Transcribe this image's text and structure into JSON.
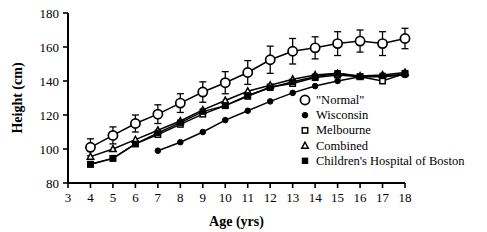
{
  "chart_data": {
    "type": "line",
    "title": "",
    "xlabel": "Age  (yrs)",
    "ylabel": "Height  (cm)",
    "xlim": [
      3,
      18
    ],
    "ylim": [
      80,
      180
    ],
    "xticks": [
      3,
      4,
      5,
      6,
      7,
      8,
      9,
      10,
      11,
      12,
      13,
      14,
      15,
      16,
      17,
      18
    ],
    "yticks": [
      80,
      100,
      120,
      140,
      160,
      180
    ],
    "grid": false,
    "legend_position": "inside-bottom-right",
    "series": [
      {
        "name": "\"Normal\"",
        "marker": "open-circle",
        "x": [
          4,
          5,
          6,
          7,
          8,
          9,
          10,
          11,
          12,
          13,
          14,
          15,
          16,
          17,
          18
        ],
        "values": [
          101,
          108,
          115,
          120.5,
          127,
          133.5,
          139,
          145,
          152.5,
          157.5,
          159.5,
          162,
          163.5,
          162,
          165
        ],
        "errors": [
          5,
          5,
          5,
          5.5,
          5.5,
          6,
          6.5,
          7,
          8,
          7.5,
          6.5,
          7,
          6.5,
          7,
          6
        ]
      },
      {
        "name": "Wisconsin",
        "marker": "filled-circle",
        "x": [
          7,
          8,
          9,
          10,
          11,
          12,
          13,
          14,
          15,
          16,
          17,
          18
        ],
        "values": [
          99,
          104,
          110,
          117,
          122.5,
          128,
          133,
          137,
          140,
          142.5,
          142.5,
          143.5
        ],
        "errors": [
          0,
          0,
          0,
          0,
          0,
          0,
          0,
          0,
          0,
          0,
          0,
          0
        ]
      },
      {
        "name": "Melbourne",
        "marker": "open-square",
        "x": [
          4,
          5,
          6,
          7,
          8,
          9,
          10,
          11,
          12,
          13,
          14,
          15,
          16,
          17,
          18
        ],
        "values": [
          91,
          94.5,
          103,
          108.5,
          114.5,
          120.5,
          125.5,
          131,
          136.5,
          138.5,
          142,
          143.5,
          142.5,
          140,
          144.5
        ],
        "errors": [
          0,
          0,
          0,
          0,
          0,
          0,
          0,
          0,
          0,
          0,
          0,
          0,
          0,
          0,
          0
        ]
      },
      {
        "name": "Combined",
        "marker": "open-triangle",
        "x": [
          4,
          5,
          6,
          7,
          8,
          9,
          10,
          11,
          12,
          13,
          14,
          15,
          16,
          17,
          18
        ],
        "values": [
          95.5,
          100,
          105.5,
          111,
          116.5,
          123,
          128.5,
          134,
          137.5,
          141,
          143.5,
          144.5,
          143,
          143.5,
          145
        ],
        "errors": [
          0,
          0,
          0,
          0,
          0,
          0,
          0,
          0,
          0,
          0,
          0,
          0,
          0,
          0,
          0
        ]
      },
      {
        "name": "Children's Hospital of Boston",
        "marker": "filled-square",
        "x": [
          4,
          5,
          6,
          7,
          8,
          9,
          10,
          11,
          12,
          13,
          14,
          15,
          16,
          17,
          18
        ],
        "values": [
          91,
          94.5,
          103,
          109.5,
          115.5,
          122,
          125.5,
          131.5,
          136,
          139.5,
          142.5,
          144.5,
          142.5,
          143,
          144
        ],
        "errors": [
          0,
          0,
          0,
          0,
          0,
          0,
          0,
          0,
          0,
          0,
          0,
          0,
          0,
          0,
          0
        ]
      }
    ],
    "legend": [
      {
        "label": "\"Normal\"",
        "marker": "open-circle"
      },
      {
        "label": "Wisconsin",
        "marker": "filled-circle"
      },
      {
        "label": "Melbourne",
        "marker": "open-square"
      },
      {
        "label": "Combined",
        "marker": "open-triangle"
      },
      {
        "label": "Children's Hospital of Boston",
        "marker": "filled-square"
      }
    ],
    "colors": {
      "line": "#000000",
      "axis": "#000000",
      "background": "#ffffff"
    }
  }
}
